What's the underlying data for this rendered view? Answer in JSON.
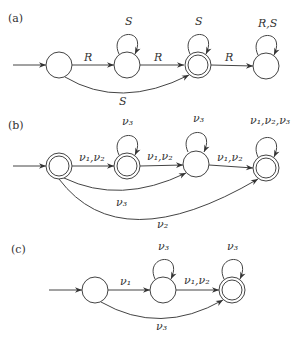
{
  "diagrams": [
    {
      "id": "a",
      "label": "(a)",
      "edge_labels": {
        "r1": "R",
        "s_loop2": "S",
        "r2": "R",
        "s_loop3": "S",
        "r3": "R",
        "rs_loop4": "R,S",
        "s_skip": "S"
      },
      "accepting_states": [
        3
      ]
    },
    {
      "id": "b",
      "label": "(b)",
      "edge_labels": {
        "v12_a": "ν₁,ν₂",
        "v3_loop2": "ν₃",
        "v12_b": "ν₁,ν₂",
        "v3_loop3": "ν₃",
        "v12_c": "ν₁,ν₂",
        "v123_loop4": "ν₁,ν₂,ν₃",
        "v3_skip": "ν₃",
        "v2_skip": "ν₂"
      },
      "accepting_states": [
        1,
        2,
        4
      ]
    },
    {
      "id": "c",
      "label": "(c)",
      "edge_labels": {
        "v1": "ν₁",
        "v3_loop2": "ν₃",
        "v12": "ν₁,ν₂",
        "v3_loop3": "ν₃",
        "v3_skip": "ν₃"
      },
      "accepting_states": [
        3
      ]
    }
  ]
}
